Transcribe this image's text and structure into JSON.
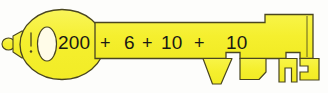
{
  "illustration": {
    "name": "yellow-key-with-addition-expression",
    "description": "Cartoon yellow key drawing with an arithmetic expansion written along the shank",
    "colors": {
      "key_fill": "#f5ef2e",
      "key_fill_light": "#faf76a",
      "key_outline": "#4a4620",
      "hole_fill": "#fffce8",
      "background": "#fdfdfb",
      "text": "#1a1a14"
    }
  },
  "expression": {
    "full_text": "200 + 6 + 10 + 10",
    "sum": 226,
    "tokens": [
      {
        "text": "200",
        "kind": "number",
        "x": 58,
        "y": 33
      },
      {
        "text": "+",
        "kind": "operator",
        "x": 100,
        "y": 34
      },
      {
        "text": "6",
        "kind": "number",
        "x": 124,
        "y": 33
      },
      {
        "text": "+",
        "kind": "operator",
        "x": 142,
        "y": 34
      },
      {
        "text": "10",
        "kind": "number",
        "x": 161,
        "y": 33
      },
      {
        "text": "+",
        "kind": "operator",
        "x": 194,
        "y": 34
      },
      {
        "text": "10",
        "kind": "number",
        "x": 226,
        "y": 33
      }
    ]
  },
  "parts": {
    "bow_label": "key bow",
    "bow_hole_label": "key bow hole",
    "ring_loop_label": "key ring loop",
    "tick_mark_label": "bow tick mark",
    "shank_label": "key shank",
    "teeth_label": "key teeth",
    "tooth_triangle_label": "triangular tooth",
    "tooth_block_label": "block tooth",
    "tooth_notched_label": "notched tooth",
    "tooth_tip_label": "tip tooth"
  }
}
